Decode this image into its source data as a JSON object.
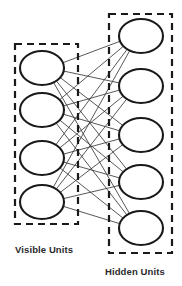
{
  "diagram": {
    "type": "neural-network-bipartite-graph",
    "canvas": {
      "width": 182,
      "height": 286,
      "background": "#ffffff"
    },
    "colors": {
      "node_stroke": "#1a1a1a",
      "node_fill": "#ffffff",
      "edge_stroke": "#3a3a3a",
      "box_stroke": "#1a1a1a",
      "label_color": "#2b2b2b"
    },
    "layers": [
      {
        "id": "visible",
        "label": "Visible Units",
        "label_position": "bottom-left",
        "unit_count": 4,
        "box": {
          "x": 15,
          "y": 44,
          "width": 63,
          "height": 180,
          "dashed": true
        },
        "node_shape": "ellipse",
        "node_rx": 22,
        "node_ry": 17,
        "node_cx": 42,
        "node_cy": [
          68,
          110,
          158,
          202
        ]
      },
      {
        "id": "hidden",
        "label": "Hidden Units",
        "label_position": "bottom-right",
        "unit_count": 5,
        "box": {
          "x": 109,
          "y": 14,
          "width": 63,
          "height": 239,
          "dashed": true
        },
        "node_shape": "ellipse",
        "node_rx": 22,
        "node_ry": 17,
        "node_cx": 141,
        "node_cy": [
          36,
          86,
          135,
          182,
          228
        ]
      }
    ],
    "connections": {
      "scheme": "fully-connected-bipartite",
      "from_layer": "visible",
      "to_layer": "hidden",
      "edge_count": 20,
      "intra_layer_edges": 0
    }
  }
}
